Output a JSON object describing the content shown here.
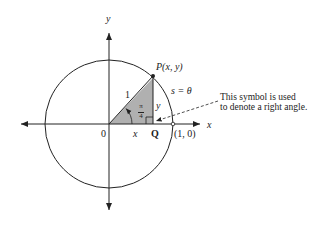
{
  "diagram": {
    "type": "unit-circle",
    "axes": {
      "x_label": "x",
      "y_label": "y"
    },
    "labels": {
      "origin": "0",
      "point_p": "P(x, y)",
      "point_q": "Q",
      "point_one_zero": "(1, 0)",
      "hypotenuse": "1",
      "adjacent": "x",
      "opposite": "y",
      "arc": "s = θ",
      "angle_num": "π",
      "angle_den": "4"
    },
    "annotation": {
      "line1": "This symbol is used",
      "line2": "to denote a right angle."
    },
    "colors": {
      "stroke": "#222222",
      "fill": "#b0b0b0",
      "background": "#ffffff"
    }
  }
}
